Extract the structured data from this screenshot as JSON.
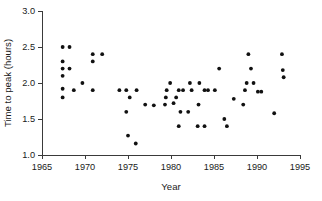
{
  "chart_data": {
    "type": "scatter",
    "title": "",
    "xlabel": "Year",
    "ylabel": "Time to peak (hours)",
    "xlim": [
      1965,
      1995
    ],
    "ylim": [
      1.0,
      3.0
    ],
    "xticks": [
      1965,
      1970,
      1975,
      1980,
      1985,
      1990,
      1995
    ],
    "xtick_labels": [
      "1965",
      "1970",
      "1975",
      "1980",
      "1985",
      "1990",
      "1995"
    ],
    "yticks": [
      1.0,
      1.5,
      2.0,
      2.5,
      3.0
    ],
    "ytick_labels": [
      "1.0",
      "1.5",
      "2.0",
      "2.5",
      "3.0"
    ],
    "grid": false,
    "legend": null,
    "marker": "filled-circle",
    "marker_color": "#111111",
    "marker_size_px": 3.0,
    "points": [
      {
        "x": 1967.4,
        "y": 2.5
      },
      {
        "x": 1968.2,
        "y": 2.5
      },
      {
        "x": 1967.4,
        "y": 2.3
      },
      {
        "x": 1967.4,
        "y": 2.2
      },
      {
        "x": 1968.2,
        "y": 2.2
      },
      {
        "x": 1967.4,
        "y": 2.1
      },
      {
        "x": 1967.4,
        "y": 1.92
      },
      {
        "x": 1968.7,
        "y": 1.9
      },
      {
        "x": 1967.4,
        "y": 1.8
      },
      {
        "x": 1969.7,
        "y": 2.0
      },
      {
        "x": 1970.9,
        "y": 2.4
      },
      {
        "x": 1970.9,
        "y": 2.3
      },
      {
        "x": 1970.9,
        "y": 1.9
      },
      {
        "x": 1972.0,
        "y": 2.4
      },
      {
        "x": 1974.0,
        "y": 1.9
      },
      {
        "x": 1974.8,
        "y": 1.9
      },
      {
        "x": 1976.0,
        "y": 1.9
      },
      {
        "x": 1975.2,
        "y": 1.8
      },
      {
        "x": 1974.8,
        "y": 1.6
      },
      {
        "x": 1975.0,
        "y": 1.27
      },
      {
        "x": 1975.9,
        "y": 1.16
      },
      {
        "x": 1977.0,
        "y": 1.7
      },
      {
        "x": 1978.0,
        "y": 1.69
      },
      {
        "x": 1979.4,
        "y": 1.8
      },
      {
        "x": 1979.9,
        "y": 2.0
      },
      {
        "x": 1979.5,
        "y": 1.9
      },
      {
        "x": 1979.3,
        "y": 1.7
      },
      {
        "x": 1980.6,
        "y": 1.8
      },
      {
        "x": 1980.9,
        "y": 1.9
      },
      {
        "x": 1981.4,
        "y": 1.9
      },
      {
        "x": 1980.3,
        "y": 1.72
      },
      {
        "x": 1981.1,
        "y": 1.6
      },
      {
        "x": 1982.0,
        "y": 1.6
      },
      {
        "x": 1980.9,
        "y": 1.4
      },
      {
        "x": 1982.2,
        "y": 2.0
      },
      {
        "x": 1982.4,
        "y": 1.9
      },
      {
        "x": 1983.3,
        "y": 2.0
      },
      {
        "x": 1983.2,
        "y": 1.7
      },
      {
        "x": 1983.9,
        "y": 1.9
      },
      {
        "x": 1984.3,
        "y": 1.9
      },
      {
        "x": 1983.1,
        "y": 1.4
      },
      {
        "x": 1983.9,
        "y": 1.4
      },
      {
        "x": 1985.1,
        "y": 1.9
      },
      {
        "x": 1985.6,
        "y": 2.2
      },
      {
        "x": 1986.2,
        "y": 1.5
      },
      {
        "x": 1986.5,
        "y": 1.4
      },
      {
        "x": 1987.3,
        "y": 1.78
      },
      {
        "x": 1988.6,
        "y": 1.9
      },
      {
        "x": 1988.8,
        "y": 2.0
      },
      {
        "x": 1989.0,
        "y": 2.4
      },
      {
        "x": 1989.3,
        "y": 2.2
      },
      {
        "x": 1989.6,
        "y": 2.0
      },
      {
        "x": 1988.4,
        "y": 1.7
      },
      {
        "x": 1990.1,
        "y": 1.88
      },
      {
        "x": 1990.5,
        "y": 1.88
      },
      {
        "x": 1992.0,
        "y": 1.58
      },
      {
        "x": 1992.9,
        "y": 2.4
      },
      {
        "x": 1993.0,
        "y": 2.18
      },
      {
        "x": 1993.1,
        "y": 2.08
      }
    ]
  },
  "colors": {
    "background": "#ffffff",
    "axis": "#3a3a3a",
    "text": "#1a1a1a",
    "marker": "#111111"
  }
}
